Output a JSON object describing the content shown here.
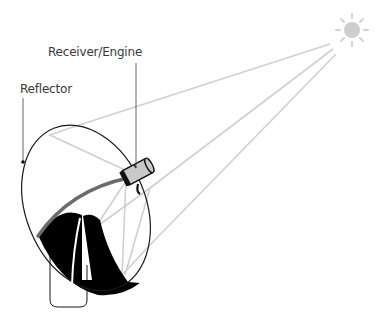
{
  "diagram": {
    "labels": {
      "receiver": "Receiver/Engine",
      "reflector": "Reflector"
    },
    "components": [
      "sun",
      "light-rays",
      "reflector-dish",
      "receiver-engine",
      "support-post"
    ],
    "colors": {
      "rays": "#cfcfcf",
      "sun": "#c8c8c8",
      "outline": "#1a1a1a",
      "receiver_body": "#c9c9c9",
      "arm": "#6b6b6b",
      "dish_shadow": "#000000"
    }
  }
}
